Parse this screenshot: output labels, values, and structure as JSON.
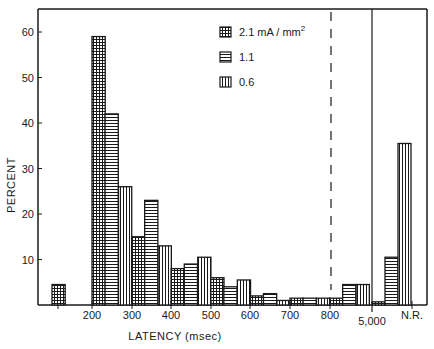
{
  "chart_data": {
    "type": "bar",
    "title": "",
    "xlabel": "LATENCY  (msec)",
    "ylabel": "PERCENT",
    "ylim": [
      0,
      65
    ],
    "yticks": [
      10,
      20,
      30,
      40,
      50,
      60
    ],
    "xtick_labels": [
      "200",
      "300",
      "400",
      "500",
      "600",
      "700",
      "800",
      "5,000",
      "N.R."
    ],
    "legend": [
      {
        "name": "2.1 mA / mm",
        "superscript": "2",
        "pattern": "grid"
      },
      {
        "name": "1.1",
        "pattern": "horizontal"
      },
      {
        "name": "0.6",
        "pattern": "vertical"
      }
    ],
    "bars": [
      {
        "x_start": 100,
        "series": "2.1",
        "value": 4.5
      },
      {
        "x_start": 200,
        "series": "2.1",
        "value": 59
      },
      {
        "x_start": 233,
        "series": "1.1",
        "value": 42
      },
      {
        "x_start": 267,
        "series": "0.6",
        "value": 26
      },
      {
        "x_start": 300,
        "series": "2.1",
        "value": 15
      },
      {
        "x_start": 333,
        "series": "1.1",
        "value": 23
      },
      {
        "x_start": 367,
        "series": "0.6",
        "value": 13
      },
      {
        "x_start": 400,
        "series": "2.1",
        "value": 8
      },
      {
        "x_start": 433,
        "series": "1.1",
        "value": 9
      },
      {
        "x_start": 467,
        "series": "0.6",
        "value": 10.5
      },
      {
        "x_start": 500,
        "series": "2.1",
        "value": 6
      },
      {
        "x_start": 533,
        "series": "1.1",
        "value": 4
      },
      {
        "x_start": 567,
        "series": "0.6",
        "value": 5.5
      },
      {
        "x_start": 600,
        "series": "2.1",
        "value": 2
      },
      {
        "x_start": 633,
        "series": "1.1",
        "value": 2.5
      },
      {
        "x_start": 667,
        "series": "0.6",
        "value": 1
      },
      {
        "x_start": 700,
        "series": "2.1",
        "value": 1.5
      },
      {
        "x_start": 733,
        "series": "1.1",
        "value": 1.5
      },
      {
        "x_start": 767,
        "series": "0.6",
        "value": 1.5
      },
      {
        "x_start": 800,
        "series": "2.1",
        "value": 1.5
      },
      {
        "x_start": 833,
        "series": "1.1",
        "value": 4.5
      },
      {
        "x_start": 867,
        "series": "0.6",
        "value": 4.5
      },
      {
        "x_start": "N.R.",
        "series": "2.1",
        "value": 0.7
      },
      {
        "x_start": "N.R.",
        "series": "1.1",
        "value": 10.5
      },
      {
        "x_start": "N.R.",
        "series": "0.6",
        "value": 35.5
      }
    ],
    "annotations": [
      {
        "type": "dashed-vertical-line",
        "at": 800
      },
      {
        "type": "solid-vertical-line",
        "at": "5,000"
      }
    ],
    "grid": false,
    "legend_position": "upper center"
  }
}
